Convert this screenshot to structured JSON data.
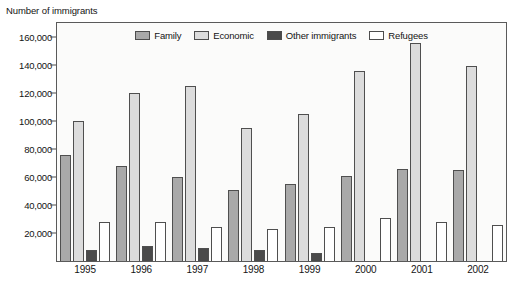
{
  "chart_data": {
    "type": "bar",
    "title": "",
    "ylabel": "Number of immigrants",
    "xlabel": "",
    "ylim": [
      0,
      170000
    ],
    "ytick_values": [
      20000,
      40000,
      60000,
      80000,
      100000,
      120000,
      140000,
      160000
    ],
    "ytick_labels": [
      "20,000",
      "40,000",
      "60,000",
      "80,000",
      "100,000",
      "120,000",
      "140,000",
      "160,000"
    ],
    "grid": false,
    "legend_position": "top-center",
    "categories": [
      "1995",
      "1996",
      "1997",
      "1998",
      "1999",
      "2000",
      "2001",
      "2002"
    ],
    "series": [
      {
        "name": "Family",
        "color": "#a9a9a9",
        "values": [
          76000,
          68000,
          60000,
          51000,
          55000,
          61000,
          66000,
          65000
        ]
      },
      {
        "name": "Economic",
        "color": "#dcdcdc",
        "values": [
          100000,
          120000,
          125000,
          95000,
          105000,
          136000,
          156000,
          139000
        ]
      },
      {
        "name": "Other immigrants",
        "color": "#4a4a4a",
        "values": [
          8000,
          11000,
          9000,
          8000,
          6000,
          0,
          0,
          0
        ]
      },
      {
        "name": "Refugees",
        "color": "#ffffff",
        "values": [
          28000,
          28000,
          24500,
          23000,
          24500,
          30500,
          28000,
          25500
        ]
      }
    ]
  },
  "colors": {
    "axis": "#4d4d4d",
    "text": "#141414",
    "plot_background": "#fbfbfa",
    "page_background": "#ffffff"
  }
}
